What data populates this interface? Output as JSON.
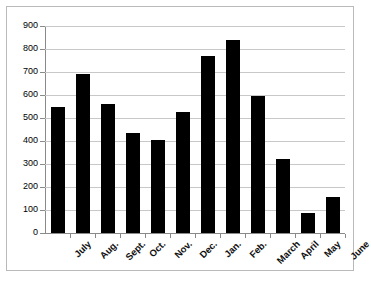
{
  "chart_data": {
    "type": "bar",
    "title": "",
    "subtitle": "",
    "xlabel": "",
    "ylabel": "",
    "categories": [
      "July",
      "Aug.",
      "Sept.",
      "Oct.",
      "Nov.",
      "Dec.",
      "Jan.",
      "Feb.",
      "March",
      "April",
      "May",
      "June"
    ],
    "values": [
      550,
      690,
      560,
      435,
      405,
      525,
      770,
      840,
      595,
      322,
      85,
      155
    ],
    "ylim": [
      0,
      900
    ],
    "ytick_labels": [
      "900",
      "800",
      "700",
      "600",
      "500",
      "400",
      "300",
      "200",
      "100",
      "0"
    ],
    "ytick_values": [
      900,
      800,
      700,
      600,
      500,
      400,
      300,
      200,
      100,
      0
    ],
    "grid": true,
    "legend": null,
    "legend_position": "none",
    "bar_color": "#000000",
    "gridline_color": "#c8c8c8",
    "axis_color": "#8a8a8a",
    "frame_color": "#b9b9b9",
    "background_color": "#ffffff",
    "xtick_label_rotation": -45
  }
}
